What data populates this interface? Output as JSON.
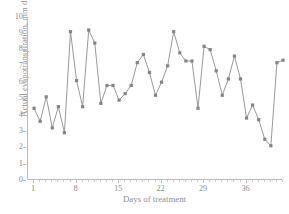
{
  "chart_data": {
    "type": "line",
    "title": "",
    "subtitle": "",
    "xlabel": "Days of treatment",
    "ylabel": "Actual evapotranspiration, mm d",
    "ylabel_superscript": "-1",
    "ylabel_full": "Actual evapotranspiration, mm d-1",
    "xlim": [
      0,
      42
    ],
    "ylim": [
      0,
      10
    ],
    "grid": false,
    "legend": false,
    "legend_position": "none",
    "marker": "square",
    "marker_color": "#858585",
    "line_color": "#9a9a9a",
    "axis_color": "#bdbdbd",
    "text_color": "#8f8f8f",
    "background": "#ffffff",
    "ytick_labels": [
      "0",
      "1",
      "2",
      "3",
      "4",
      "5",
      "6",
      "7",
      "8",
      "9",
      "10"
    ],
    "ytick_values": [
      0,
      1,
      2,
      3,
      4,
      5,
      6,
      7,
      8,
      9,
      10
    ],
    "xtick_labels": [
      "1",
      "8",
      "15",
      "22",
      "29",
      "36"
    ],
    "xtick_values": [
      1,
      8,
      15,
      22,
      29,
      36
    ],
    "x": [
      1,
      2,
      3,
      4,
      5,
      6,
      7,
      8,
      9,
      10,
      11,
      12,
      13,
      14,
      15,
      16,
      17,
      18,
      19,
      20,
      21,
      22,
      23,
      24,
      25,
      26,
      27,
      28,
      29,
      30,
      31,
      32,
      33,
      34,
      35,
      36,
      37,
      38,
      39,
      40,
      41,
      42
    ],
    "values": [
      4.4,
      3.6,
      5.1,
      3.2,
      4.5,
      2.9,
      9.1,
      6.1,
      4.5,
      9.2,
      8.4,
      4.7,
      5.8,
      5.8,
      4.9,
      5.3,
      5.8,
      7.2,
      7.7,
      6.6,
      5.2,
      6.0,
      7.0,
      9.1,
      7.8,
      7.3,
      7.3,
      4.4,
      8.2,
      8.0,
      6.7,
      5.2,
      6.2,
      7.6,
      6.2,
      3.8,
      4.6,
      3.7,
      2.5,
      2.1,
      7.2,
      7.35
    ],
    "series": [
      {
        "name": "Actual evapotranspiration",
        "values": [
          4.4,
          3.6,
          5.1,
          3.2,
          4.5,
          2.9,
          9.1,
          6.1,
          4.5,
          9.2,
          8.4,
          4.7,
          5.8,
          5.8,
          4.9,
          5.3,
          5.8,
          7.2,
          7.7,
          6.6,
          5.2,
          6.0,
          7.0,
          9.1,
          7.8,
          7.3,
          7.3,
          4.4,
          8.2,
          8.0,
          6.7,
          5.2,
          6.2,
          7.6,
          6.2,
          3.8,
          4.6,
          3.7,
          2.5,
          2.1,
          7.2,
          7.35
        ]
      }
    ]
  }
}
